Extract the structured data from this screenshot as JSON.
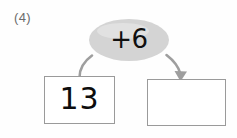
{
  "worksheet": {
    "problem_number": "(4)",
    "background_color": "#ffffff"
  },
  "operation": {
    "label": "+6",
    "operator": "+",
    "operand": "6",
    "bubble_fill_color": "#d4d4d4",
    "shape": "ellipse"
  },
  "boxes": {
    "input": {
      "value": "13",
      "border_color": "#9a9a9a",
      "fill_color": "#ffffff"
    },
    "answer": {
      "value": "",
      "border_color": "#9a9a9a",
      "fill_color": "#ffffff"
    }
  },
  "connectors": {
    "input_curve": {
      "name": "input-to-operation-curve",
      "stroke_color": "#9e9e9e",
      "has_arrowhead": false
    },
    "output_arrow": {
      "name": "operation-to-answer-arrow",
      "stroke_color": "#9e9e9e",
      "has_arrowhead": true,
      "arrow_direction": "down"
    }
  }
}
